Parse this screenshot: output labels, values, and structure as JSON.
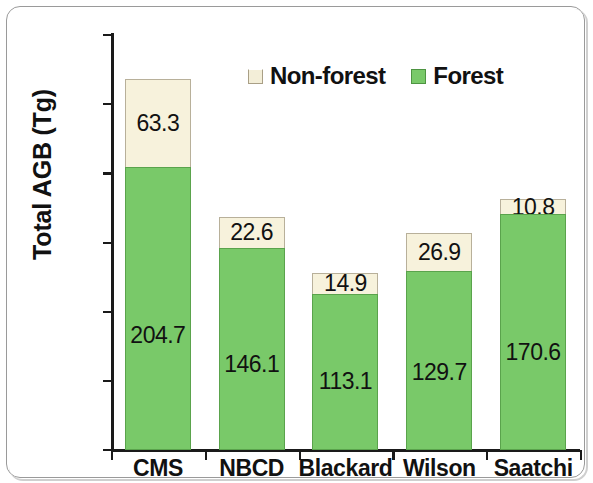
{
  "chart_data": {
    "type": "bar",
    "stacked": true,
    "title": "",
    "xlabel": "",
    "ylabel": "Total AGB (Tg)",
    "ylim": [
      0,
      300
    ],
    "yticks": [
      0,
      50,
      100,
      150,
      200,
      250,
      300
    ],
    "ytick_labels": [
      "0",
      "50",
      "100",
      "150",
      "200",
      "250",
      "300"
    ],
    "grid": false,
    "legend_position": "top-center",
    "categories": [
      "CMS",
      "NBCD",
      "Blackard",
      "Wilson",
      "Saatchi"
    ],
    "series": [
      {
        "name": "Forest",
        "color": "#79c969",
        "values": [
          204.7,
          146.1,
          113.1,
          129.7,
          170.6
        ],
        "labels": [
          "204.7",
          "146.1",
          "113.1",
          "129.7",
          "170.6"
        ]
      },
      {
        "name": "Non-forest",
        "color": "#f7f2dc",
        "values": [
          63.3,
          22.6,
          14.9,
          26.9,
          10.8
        ],
        "labels": [
          "63.3",
          "22.6",
          "14.9",
          "26.9",
          "10.8"
        ]
      }
    ],
    "totals": [
      268.0,
      168.7,
      128.0,
      156.6,
      181.4
    ]
  },
  "legend": {
    "items": [
      {
        "label": "Non-forest",
        "swatch": "nonforest-swatch"
      },
      {
        "label": "Forest",
        "swatch": "forest-swatch"
      }
    ]
  },
  "axes": {
    "y_title": "Total AGB (Tg)"
  }
}
